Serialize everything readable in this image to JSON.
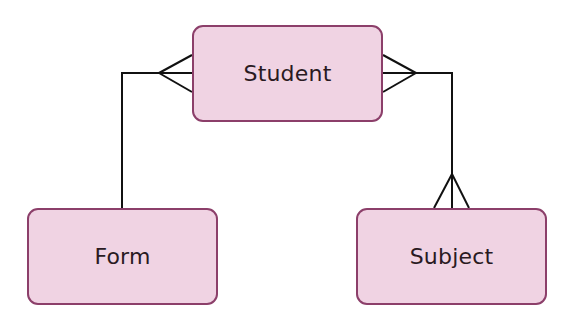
{
  "diagram": {
    "type": "entity-relationship",
    "entities": [
      {
        "id": "student",
        "label": "Student"
      },
      {
        "id": "form",
        "label": "Form"
      },
      {
        "id": "subject",
        "label": "Subject"
      }
    ],
    "relationships": [
      {
        "from": "form",
        "to": "student",
        "cardinality": "one-to-many",
        "many_end": "student"
      },
      {
        "from": "student",
        "to": "subject",
        "cardinality": "many-to-many",
        "many_end": "both"
      }
    ],
    "colors": {
      "entity_fill": "#f0d3e3",
      "entity_border": "#8c3f6a",
      "line": "#111111"
    }
  }
}
